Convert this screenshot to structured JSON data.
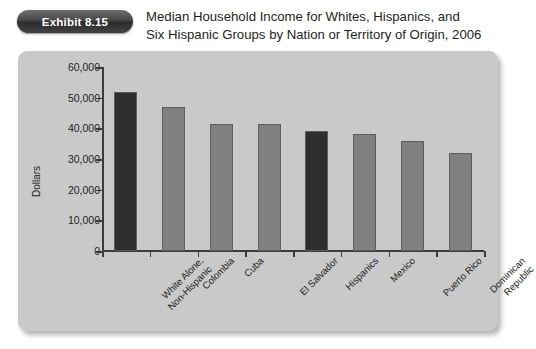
{
  "header": {
    "exhibit_badge": "Exhibit 8.15",
    "title_line_1": "Median Household Income for Whites, Hispanics, and",
    "title_line_2": "Six Hispanic Groups by Nation or Territory of Origin, 2006"
  },
  "colors": {
    "panel_background": "#c9c9c9",
    "page_background": "#ffffff",
    "bar_highlight": "#2e2e2e",
    "bar_default": "#808080",
    "axis": "#3b3b3b",
    "text": "#231f20",
    "badge_text": "#ffffff"
  },
  "chart_data": {
    "type": "bar",
    "title": "Median Household Income for Whites, Hispanics, and Six Hispanic Groups by Nation or Territory of Origin, 2006",
    "xlabel": "",
    "ylabel": "Dollars",
    "ylim": [
      0,
      60000
    ],
    "ytick_labels": [
      "60,000",
      "50,000",
      "40,000",
      "30,000",
      "20,000",
      "10,000",
      "0"
    ],
    "ytick_values": [
      60000,
      50000,
      40000,
      30000,
      20000,
      10000,
      0
    ],
    "grid": false,
    "legend": "none",
    "categories": [
      "White Alone, Non-Hispanic",
      "Colombia",
      "Cuba",
      "El Salvador",
      "Hispanics",
      "Mexico",
      "Puerto Rico",
      "Dominican Republic"
    ],
    "category_lines": [
      [
        "White Alone,",
        "Non-Hispanic"
      ],
      [
        "Colombia"
      ],
      [
        "Cuba"
      ],
      [
        "El Salvador"
      ],
      [
        "Hispanics"
      ],
      [
        "Mexico"
      ],
      [
        "Puerto Rico"
      ],
      [
        "Dominican",
        "Republic"
      ]
    ],
    "values": [
      52000,
      47000,
      41500,
      41500,
      39000,
      38000,
      36000,
      32000
    ],
    "bar_colors": [
      "#2e2e2e",
      "#808080",
      "#808080",
      "#808080",
      "#2e2e2e",
      "#808080",
      "#808080",
      "#808080"
    ]
  }
}
